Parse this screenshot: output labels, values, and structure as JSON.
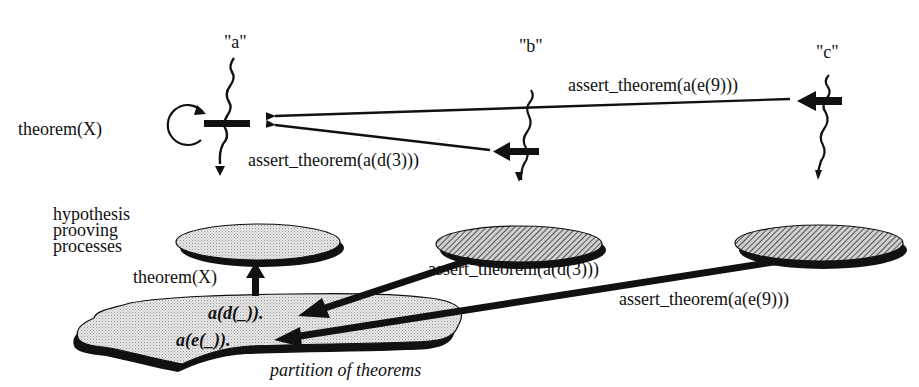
{
  "diagram": {
    "type": "process-communication-diagram",
    "colors": {
      "ink": "#111111",
      "light_fill": "#e4e4e4",
      "hatch_fill": "#9a9a9a",
      "background": "#ffffff"
    },
    "threads": [
      {
        "id": "a",
        "label": "\"a\""
      },
      {
        "id": "b",
        "label": "\"b\""
      },
      {
        "id": "c",
        "label": "\"c\""
      }
    ],
    "upper_labels": {
      "self_loop": "theorem(X)",
      "msg_from_b": "assert_theorem(a(d(3)))",
      "msg_from_c": "assert_theorem(a(e(9)))"
    },
    "lower": {
      "processes_caption": [
        "hypothesis",
        "prooving",
        "processes"
      ],
      "up_arrow_label": "theorem(X)",
      "msg_from_b": "assert_theorem(a(d(3)))",
      "msg_from_c": "assert_theorem(a(e(9)))",
      "partition_entries": [
        "a(d(_)).",
        "a(e(_))."
      ],
      "partition_caption": "partition of theorems"
    }
  }
}
